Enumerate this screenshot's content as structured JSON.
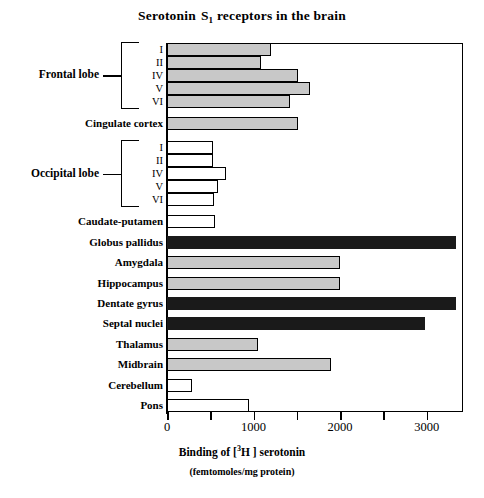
{
  "chart_data": {
    "type": "bar",
    "orientation": "horizontal",
    "title_parts": {
      "main": "Serotonin",
      "symbol": "S",
      "subscript": "1",
      "rest": "receptors in the brain"
    },
    "xlabel": "Binding of [ ³H  ] serotonin",
    "xlabel_parts": {
      "prefix": "Binding of [",
      "superscript": "3",
      "isotope": "H",
      "suffix": "] serotonin"
    },
    "xlabel_units": "(femtomoles/mg protein)",
    "ylabel": "",
    "xlim": [
      0,
      3420
    ],
    "xticks": [
      0,
      1000,
      2000,
      3000
    ],
    "xtick_labels": [
      "0",
      "1000",
      "2000",
      "3000"
    ],
    "xminor_ticks": [
      500,
      1500,
      2500
    ],
    "grid": false,
    "legend": false,
    "categories": [
      "Frontal lobe I",
      "Frontal lobe II",
      "Frontal lobe IV",
      "Frontal lobe V",
      "Frontal lobe VI",
      "Cingulate cortex",
      "Occipital lobe I",
      "Occipital lobe II",
      "Occipital lobe IV",
      "Occipital lobe V",
      "Occipital lobe VI",
      "Caudate-putamen",
      "Globus pallidus",
      "Amygdala",
      "Hippocampus",
      "Dentate gyrus",
      "Septal nuclei",
      "Thalamus",
      "Midbrain",
      "Cerebellum",
      "Pons"
    ],
    "values": [
      1200,
      1090,
      1510,
      1650,
      1420,
      1510,
      530,
      530,
      680,
      590,
      540,
      560,
      3340,
      2000,
      2000,
      3340,
      2980,
      1050,
      1890,
      290,
      950
    ],
    "bar_fills": [
      "grey",
      "grey",
      "grey",
      "grey",
      "grey",
      "grey",
      "white",
      "white",
      "white",
      "white",
      "white",
      "white",
      "black",
      "grey",
      "grey",
      "black",
      "black",
      "grey",
      "grey",
      "white",
      "white"
    ]
  },
  "rows": [
    {
      "label": "I",
      "roman": true,
      "value": 1200,
      "fill": "grey"
    },
    {
      "label": "II",
      "roman": true,
      "value": 1090,
      "fill": "grey"
    },
    {
      "label": "IV",
      "roman": true,
      "value": 1510,
      "fill": "grey"
    },
    {
      "label": "V",
      "roman": true,
      "value": 1650,
      "fill": "grey"
    },
    {
      "label": "VI",
      "roman": true,
      "value": 1420,
      "fill": "grey"
    },
    {
      "label": "Cingulate cortex",
      "roman": false,
      "value": 1510,
      "fill": "grey"
    },
    {
      "label": "I",
      "roman": true,
      "value": 530,
      "fill": "white"
    },
    {
      "label": "II",
      "roman": true,
      "value": 530,
      "fill": "white"
    },
    {
      "label": "IV",
      "roman": true,
      "value": 680,
      "fill": "white"
    },
    {
      "label": "V",
      "roman": true,
      "value": 590,
      "fill": "white"
    },
    {
      "label": "VI",
      "roman": true,
      "value": 540,
      "fill": "white"
    },
    {
      "label": "Caudate-putamen",
      "roman": false,
      "value": 560,
      "fill": "white"
    },
    {
      "label": "Globus pallidus",
      "roman": false,
      "value": 3340,
      "fill": "black"
    },
    {
      "label": "Amygdala",
      "roman": false,
      "value": 2000,
      "fill": "grey"
    },
    {
      "label": "Hippocampus",
      "roman": false,
      "value": 2000,
      "fill": "grey"
    },
    {
      "label": "Dentate gyrus",
      "roman": false,
      "value": 3340,
      "fill": "black"
    },
    {
      "label": "Septal nuclei",
      "roman": false,
      "value": 2980,
      "fill": "black"
    },
    {
      "label": "Thalamus",
      "roman": false,
      "value": 1050,
      "fill": "grey"
    },
    {
      "label": "Midbrain",
      "roman": false,
      "value": 1890,
      "fill": "grey"
    },
    {
      "label": "Cerebellum",
      "roman": false,
      "value": 290,
      "fill": "white"
    },
    {
      "label": "Pons",
      "roman": false,
      "value": 950,
      "fill": "white"
    }
  ],
  "groups": [
    {
      "label": "Frontal lobe",
      "first_row": 0,
      "last_row": 4
    },
    {
      "label": "Occipital lobe",
      "first_row": 6,
      "last_row": 10
    }
  ],
  "colors": {
    "grey_fill": "#c8c8c8",
    "white_fill": "#ffffff",
    "black_fill": "#1a1a1a",
    "outline": "#000000",
    "background": "#ffffff"
  }
}
